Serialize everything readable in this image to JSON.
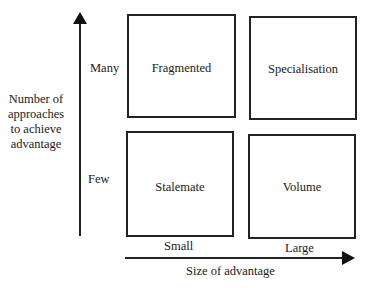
{
  "diagram": {
    "y_axis": {
      "label": [
        "Number of",
        "approaches",
        "to achieve",
        "advantage"
      ],
      "ticks": {
        "high": "Many",
        "low": "Few"
      }
    },
    "x_axis": {
      "label": "Size of advantage",
      "ticks": {
        "low": "Small",
        "high": "Large"
      }
    },
    "quadrants": {
      "top_left": "Fragmented",
      "top_right": "Specialisation",
      "bottom_left": "Stalemate",
      "bottom_right": "Volume"
    }
  }
}
